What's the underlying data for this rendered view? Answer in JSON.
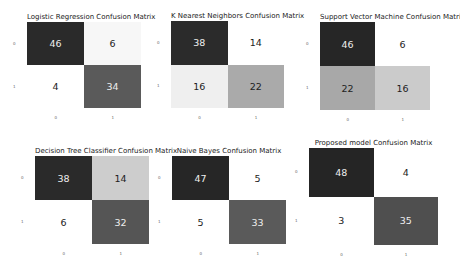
{
  "chart_data": [
    {
      "type": "heatmap",
      "title": "Logistic Regression Confusion Matrix",
      "x_ticks": [
        "0",
        "1"
      ],
      "y_ticks": [
        "0",
        "1"
      ],
      "values": [
        [
          46,
          6
        ],
        [
          4,
          34
        ]
      ],
      "colors": [
        [
          "#2a2a2a",
          "#f7f7f7"
        ],
        [
          "#ffffff",
          "#5a5a5a"
        ]
      ],
      "text_colors": [
        [
          "#eeeeee",
          "#222222"
        ],
        [
          "#222222",
          "#eeeeee"
        ]
      ],
      "box": {
        "left": 27,
        "top": 22,
        "width": 114,
        "height": 86
      }
    },
    {
      "type": "heatmap",
      "title": "K Nearest Neighbors Confusion Matrix",
      "x_ticks": [
        "0",
        "1"
      ],
      "y_ticks": [
        "0",
        "1"
      ],
      "values": [
        [
          38,
          14
        ],
        [
          16,
          22
        ]
      ],
      "colors": [
        [
          "#2b2b2b",
          "#ffffff"
        ],
        [
          "#efefef",
          "#aaaaaa"
        ]
      ],
      "text_colors": [
        [
          "#eeeeee",
          "#222222"
        ],
        [
          "#222222",
          "#222222"
        ]
      ],
      "box": {
        "left": 171,
        "top": 21,
        "width": 113,
        "height": 87
      }
    },
    {
      "type": "heatmap",
      "title": "Support Vector Machine Confusion Matrix",
      "x_ticks": [
        "0",
        "1"
      ],
      "y_ticks": [
        "0",
        "1"
      ],
      "values": [
        [
          46,
          6
        ],
        [
          22,
          16
        ]
      ],
      "colors": [
        [
          "#262626",
          "#ffffff"
        ],
        [
          "#a8a8a8",
          "#cbcbcb"
        ]
      ],
      "text_colors": [
        [
          "#eeeeee",
          "#222222"
        ],
        [
          "#222222",
          "#222222"
        ]
      ],
      "box": {
        "left": 320,
        "top": 22,
        "width": 110,
        "height": 88
      }
    },
    {
      "type": "heatmap",
      "title": "Decision Tree Classifier Confusion Matrix",
      "x_ticks": [
        "0",
        "1"
      ],
      "y_ticks": [
        "0",
        "1"
      ],
      "values": [
        [
          38,
          14
        ],
        [
          6,
          32
        ]
      ],
      "colors": [
        [
          "#2a2a2a",
          "#cdcdcd"
        ],
        [
          "#ffffff",
          "#555555"
        ]
      ],
      "text_colors": [
        [
          "#eeeeee",
          "#222222"
        ],
        [
          "#222222",
          "#eeeeee"
        ]
      ],
      "box": {
        "left": 35,
        "top": 156,
        "width": 114,
        "height": 88
      }
    },
    {
      "type": "heatmap",
      "title": "Naive Bayes Confusion Matrix",
      "x_ticks": [
        "0",
        "1"
      ],
      "y_ticks": [
        "0",
        "1"
      ],
      "values": [
        [
          47,
          5
        ],
        [
          5,
          33
        ]
      ],
      "colors": [
        [
          "#262626",
          "#ffffff"
        ],
        [
          "#ffffff",
          "#5a5a5a"
        ]
      ],
      "text_colors": [
        [
          "#eeeeee",
          "#222222"
        ],
        [
          "#222222",
          "#eeeeee"
        ]
      ],
      "box": {
        "left": 172,
        "top": 156,
        "width": 114,
        "height": 88
      }
    },
    {
      "type": "heatmap",
      "title": "Proposed model Confusion Matrix",
      "x_ticks": [
        "0",
        "1"
      ],
      "y_ticks": [
        "0",
        "1"
      ],
      "values": [
        [
          48,
          4
        ],
        [
          3,
          35
        ]
      ],
      "colors": [
        [
          "#252525",
          "#ffffff"
        ],
        [
          "#ffffff",
          "#4f4f4f"
        ]
      ],
      "text_colors": [
        [
          "#eeeeee",
          "#222222"
        ],
        [
          "#222222",
          "#eeeeee"
        ]
      ],
      "box": {
        "left": 309,
        "top": 148,
        "width": 129,
        "height": 97
      }
    }
  ]
}
